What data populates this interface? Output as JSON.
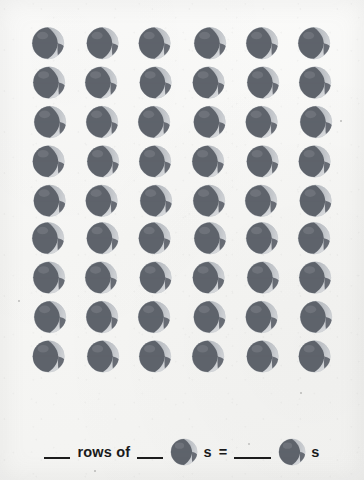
{
  "worksheet": {
    "type": "multiplication-array-worksheet",
    "background_color": "#f6f6f4",
    "ink_color": "#1a1a1a",
    "icon_name": "beach-ball-icon",
    "icon_colors": {
      "body": "#5e636b",
      "highlight": "#d8dadd",
      "shade": "#9aa0a7",
      "outline": "#c9ccd0"
    }
  },
  "array": {
    "rows": 9,
    "columns": 6,
    "total": 54,
    "cell_icon_label": "beach-ball-icon"
  },
  "equation": {
    "blank_rows": "",
    "text_rows_of": "rows of",
    "blank_per_row": "",
    "icon_left": "beach-ball-icon",
    "suffix_left": "s",
    "equals": "=",
    "blank_total": "",
    "icon_right": "beach-ball-icon",
    "suffix_right": "s",
    "full_line": "___ rows of ___ ●s = ____ ●s"
  }
}
